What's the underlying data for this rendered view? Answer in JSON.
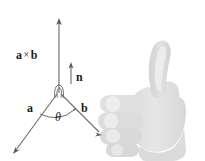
{
  "figure": {
    "background_color": "#ffffff",
    "width": 205,
    "height": 161
  },
  "labels": {
    "cross_product_left": "a",
    "cross_product_symbol": "×",
    "cross_product_right": "b",
    "normal_vector": "n",
    "vector_a": "a",
    "vector_b": "b",
    "angle": "θ"
  },
  "diagram": {
    "stroke_color": "#555555",
    "line_color": "#6b6b6b",
    "vectors": [
      {
        "name": "a-cross-b",
        "label": "a × b",
        "from": [
          59,
          92
        ],
        "to": [
          59,
          19
        ],
        "direction": "up",
        "arrowhead": true
      },
      {
        "name": "n",
        "label": "n",
        "from": [
          71,
          84
        ],
        "to": [
          71,
          63
        ],
        "direction": "up",
        "arrowhead": true
      },
      {
        "name": "a",
        "label": "a",
        "from": [
          59,
          92
        ],
        "to": [
          14,
          153
        ],
        "direction": "down-left",
        "arrowhead": true
      },
      {
        "name": "b",
        "label": "b",
        "from": [
          59,
          92
        ],
        "to": [
          101,
          134
        ],
        "direction": "down-right",
        "arrowhead": true
      }
    ],
    "angle_arc": {
      "label": "θ",
      "center": [
        59,
        92
      ],
      "radius": 22
    },
    "rotation_curl": {
      "description": "small loop at vertex indicating rotation from a to b"
    }
  },
  "hand": {
    "name": "right-hand-thumbs-up",
    "fill_color": "#e3e3e3",
    "shade_color": "#d4d4d4",
    "highlight_color": "#efefef",
    "description": "Right hand making a thumbs-up gesture, fingers curled, thumb pointing up"
  }
}
